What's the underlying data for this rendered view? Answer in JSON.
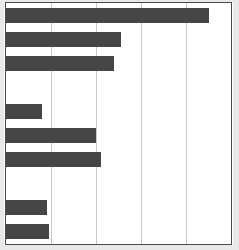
{
  "chart_data": {
    "type": "bar",
    "orientation": "horizontal",
    "title": "",
    "subtitle": "",
    "xlabel": "",
    "ylabel": "",
    "categories": [
      "1",
      "2",
      "3",
      "4",
      "5",
      "6",
      "7",
      "8",
      "9",
      "10"
    ],
    "values": [
      4.5,
      2.55,
      2.4,
      0,
      0.8,
      2.0,
      2.1,
      0,
      0.9,
      0.95
    ],
    "xlim": [
      0,
      5
    ],
    "ylim": null,
    "xticks": [
      0,
      1,
      2,
      3,
      4,
      5
    ],
    "xticklabels": [
      "",
      "",
      "",
      "",
      "",
      ""
    ],
    "yticklabels": [
      "",
      "",
      "",
      "",
      "",
      "",
      "",
      "",
      "",
      ""
    ],
    "grid": "vertical-only",
    "gridlines_x": [
      1,
      2,
      3,
      4
    ],
    "legend": null,
    "legend_position": "none",
    "annotations": [],
    "series": [
      {
        "name": "series-1",
        "values": [
          4.5,
          2.55,
          2.4,
          0,
          0.8,
          2.0,
          2.1,
          0,
          0.9,
          0.95
        ],
        "color": "#464646"
      }
    ],
    "colors": {
      "bar": "#464646",
      "gridline": "#c8c8c8",
      "frame": "#4a4a4a",
      "background": "#ffffff"
    }
  }
}
